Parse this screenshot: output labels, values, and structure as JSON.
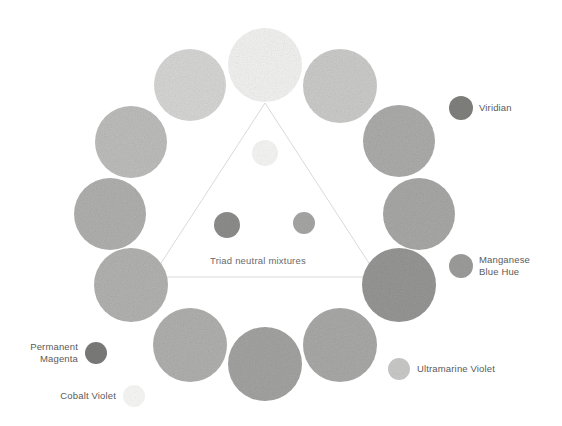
{
  "figure": {
    "type": "color-wheel-diagram",
    "background": "#ffffff",
    "center_label": "Triad neutral mixtures",
    "triangle": {
      "stroke": "#d9d9d9",
      "vertices": [
        [
          265,
          103
        ],
        [
          152,
          277
        ],
        [
          378,
          277
        ]
      ]
    }
  },
  "chart_data": {
    "type": "scatter",
    "title": "Triad neutral mixtures",
    "xlabel": "",
    "ylabel": "",
    "ring": {
      "center": [
        265,
        212
      ],
      "radius": 155,
      "count": 12,
      "circles": [
        {
          "index": 0,
          "cx": 265,
          "cy": 65,
          "r": 37,
          "fill": "#f2f2f0",
          "angle": -90
        },
        {
          "index": 1,
          "cx": 340,
          "cy": 86,
          "r": 37,
          "fill": "#cbcbc9",
          "angle": -60
        },
        {
          "index": 2,
          "cx": 399,
          "cy": 141,
          "r": 36,
          "fill": "#acacaa",
          "angle": -30
        },
        {
          "index": 3,
          "cx": 419,
          "cy": 214,
          "r": 36,
          "fill": "#a8a8a6",
          "angle": 0
        },
        {
          "index": 4,
          "cx": 399,
          "cy": 285,
          "r": 37,
          "fill": "#969694",
          "angle": 30
        },
        {
          "index": 5,
          "cx": 340,
          "cy": 345,
          "r": 37,
          "fill": "#a9a9a7",
          "angle": 60
        },
        {
          "index": 6,
          "cx": 265,
          "cy": 364,
          "r": 37,
          "fill": "#a3a3a1",
          "angle": 90
        },
        {
          "index": 7,
          "cx": 190,
          "cy": 345,
          "r": 37,
          "fill": "#b0b0ae",
          "angle": 120
        },
        {
          "index": 8,
          "cx": 131,
          "cy": 285,
          "r": 37,
          "fill": "#b2b2b0",
          "angle": 150
        },
        {
          "index": 9,
          "cx": 110,
          "cy": 214,
          "r": 36,
          "fill": "#b0b0ae",
          "angle": 180
        },
        {
          "index": 10,
          "cx": 131,
          "cy": 142,
          "r": 36,
          "fill": "#bdbdbb",
          "angle": 210
        },
        {
          "index": 11,
          "cx": 190,
          "cy": 85,
          "r": 36,
          "fill": "#d6d6d4",
          "angle": 240
        }
      ]
    },
    "mixtures": [
      {
        "name": "top-neutral",
        "cx": 265,
        "cy": 153,
        "r": 13,
        "fill": "#f4f4f2"
      },
      {
        "name": "left-neutral",
        "cx": 227,
        "cy": 225,
        "r": 13,
        "fill": "#8c8c8a"
      },
      {
        "name": "right-neutral",
        "cx": 304,
        "cy": 223,
        "r": 11,
        "fill": "#a5a5a3"
      }
    ],
    "swatches": [
      {
        "id": "viridian",
        "label": "Viridian",
        "cx": 461,
        "cy": 108,
        "r": 12,
        "fill": "#7f7f7d",
        "label_x": 479,
        "label_y": 102,
        "align": "left"
      },
      {
        "id": "manganese-blue-hue",
        "label": "Manganese\nBlue Hue",
        "cx": 461,
        "cy": 266,
        "r": 12,
        "fill": "#9c9c9a",
        "label_x": 479,
        "label_y": 254,
        "align": "left"
      },
      {
        "id": "ultramarine-violet",
        "label": "Ultramarine Violet",
        "cx": 399,
        "cy": 369,
        "r": 11,
        "fill": "#c8c8c6",
        "label_x": 417,
        "label_y": 363,
        "align": "left"
      },
      {
        "id": "permanent-magenta",
        "label": "Permanent\nMagenta",
        "cx": 96,
        "cy": 353,
        "r": 11,
        "fill": "#7a7a78",
        "label_x": 8,
        "label_y": 341,
        "align": "right"
      },
      {
        "id": "cobalt-violet",
        "label": "Cobalt Violet",
        "cx": 134,
        "cy": 396,
        "r": 11,
        "fill": "#f6f6f4",
        "label_x": 40,
        "label_y": 390,
        "align": "right"
      }
    ]
  }
}
